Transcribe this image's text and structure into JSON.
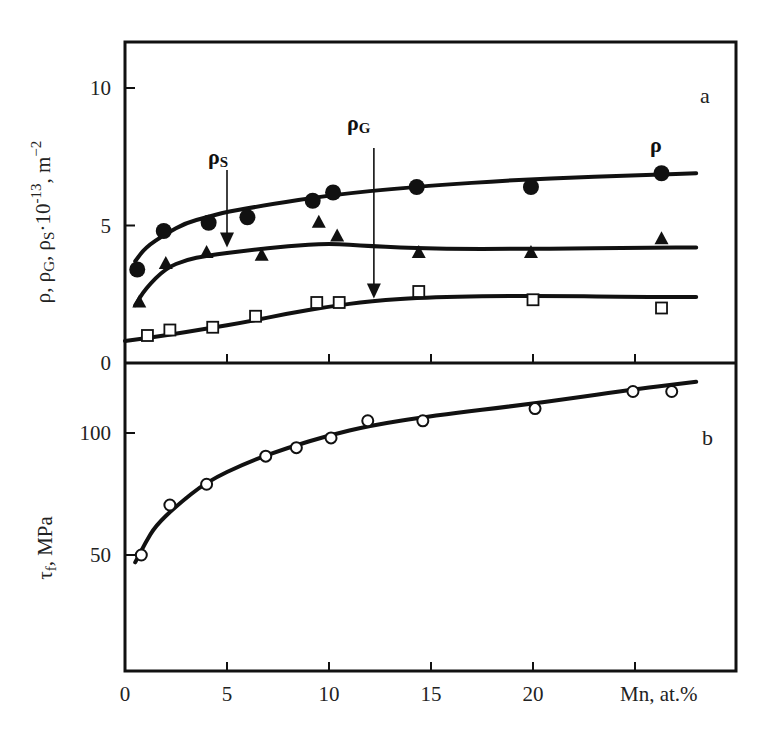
{
  "figure": {
    "panel_a_letter": "a",
    "panel_b_letter": "b",
    "x_axis_title": "Mn, at.%",
    "panel_a_ylabel": "ρ, ρG, ρS·10⁻¹³, m⁻²",
    "panel_b_ylabel": "τf, MPa",
    "annotations": {
      "rho": "ρ",
      "rho_s": "ρ",
      "rho_s_sub": "S",
      "rho_g": "ρ",
      "rho_g_sub": "G"
    },
    "colors": {
      "ink": "#111111",
      "background": "#ffffff"
    }
  },
  "chart_data": [
    {
      "type": "line",
      "panel": "a",
      "title": "",
      "xlabel": "Mn, at.%",
      "ylabel": "ρ, ρG, ρS·10^-13, m^-2",
      "xlim": [
        0,
        30
      ],
      "ylim": [
        0,
        12.5
      ],
      "x_ticks": [
        0,
        5,
        10,
        15,
        20,
        25
      ],
      "x_tick_labels": [
        "0",
        "5",
        "10",
        "15",
        "20",
        ""
      ],
      "y_ticks": [
        0,
        5,
        10
      ],
      "y_tick_labels": [
        "0",
        "5",
        "10"
      ],
      "grid": false,
      "legend": "inline labels (ρ, ρS, ρG) with arrows",
      "series": [
        {
          "name": "ρ",
          "marker": "filled-circle",
          "x": [
            0.6,
            1.9,
            4.1,
            6.0,
            9.2,
            10.2,
            14.3,
            19.9,
            26.3
          ],
          "values": [
            3.4,
            4.8,
            5.1,
            5.3,
            5.9,
            6.2,
            6.4,
            6.4,
            6.9
          ],
          "fit_x": [
            0.5,
            1.0,
            2.0,
            3.0,
            4.0,
            5.0,
            7.0,
            10.0,
            14.0,
            20.0,
            26.0,
            28.0
          ],
          "fit_y": [
            3.7,
            4.2,
            4.7,
            5.1,
            5.3,
            5.5,
            5.75,
            6.1,
            6.4,
            6.7,
            6.85,
            6.9
          ]
        },
        {
          "name": "ρS",
          "marker": "filled-triangle",
          "x": [
            0.7,
            2.0,
            4.0,
            6.7,
            9.5,
            10.4,
            14.4,
            19.9,
            26.3
          ],
          "values": [
            2.2,
            3.6,
            4.0,
            3.9,
            5.1,
            4.6,
            4.0,
            4.0,
            4.5
          ],
          "fit_x": [
            0.5,
            1.0,
            2.0,
            3.0,
            4.0,
            6.0,
            8.0,
            10.0,
            12.0,
            15.0,
            20.0,
            26.0,
            28.0
          ],
          "fit_y": [
            2.1,
            2.7,
            3.45,
            3.75,
            3.9,
            4.1,
            4.25,
            4.35,
            4.25,
            4.15,
            4.15,
            4.2,
            4.2
          ]
        },
        {
          "name": "ρG",
          "marker": "open-square",
          "x": [
            1.1,
            2.2,
            4.3,
            6.4,
            9.4,
            10.5,
            14.4,
            20.0,
            26.3
          ],
          "values": [
            1.0,
            1.2,
            1.3,
            1.7,
            2.2,
            2.2,
            2.6,
            2.3,
            2.0
          ],
          "fit_x": [
            0.0,
            2.0,
            4.0,
            6.0,
            8.0,
            10.0,
            12.0,
            15.0,
            20.0,
            25.0,
            28.0
          ],
          "fit_y": [
            0.8,
            1.0,
            1.25,
            1.5,
            1.8,
            2.05,
            2.25,
            2.4,
            2.45,
            2.4,
            2.4
          ]
        }
      ],
      "annotations": [
        {
          "text": "ρS",
          "arrow_from": [
            5.0,
            8.0
          ],
          "arrow_to": [
            5.0,
            4.2
          ]
        },
        {
          "text": "ρG",
          "arrow_from": [
            12.2,
            9.0
          ],
          "arrow_to": [
            12.2,
            2.35
          ]
        },
        {
          "text": "ρ",
          "position": [
            26.3,
            7.7
          ]
        },
        {
          "text": "a",
          "position": [
            28.5,
            10.8
          ]
        }
      ]
    },
    {
      "type": "line",
      "panel": "b",
      "title": "",
      "xlabel": "Mn, at.%",
      "ylabel": "τf, MPa",
      "xlim": [
        0,
        30
      ],
      "ylim": [
        2.5,
        128
      ],
      "x_ticks": [
        0,
        5,
        10,
        15,
        20,
        25
      ],
      "x_tick_labels": [
        "0",
        "5",
        "10",
        "15",
        "20",
        "Mn, at.%"
      ],
      "y_ticks": [
        50,
        100
      ],
      "y_tick_labels": [
        "50",
        "100"
      ],
      "grid": false,
      "series": [
        {
          "name": "τf",
          "marker": "open-circle",
          "x": [
            0.8,
            2.2,
            4.0,
            6.9,
            8.4,
            10.1,
            11.9,
            14.6,
            20.1,
            24.9,
            26.8
          ],
          "values": [
            50,
            70.5,
            79,
            90.5,
            94,
            98,
            105,
            105,
            110,
            117,
            117
          ],
          "fit_x": [
            0.5,
            1.0,
            1.5,
            2.5,
            4.0,
            6.0,
            8.0,
            10.0,
            12.0,
            15.0,
            20.0,
            25.0,
            28.0
          ],
          "fit_y": [
            47,
            55,
            62,
            70,
            80,
            88,
            94,
            99,
            103,
            107,
            112,
            118,
            121
          ]
        }
      ],
      "annotations": [
        {
          "text": "b",
          "position": [
            28.5,
            107
          ]
        }
      ]
    }
  ]
}
